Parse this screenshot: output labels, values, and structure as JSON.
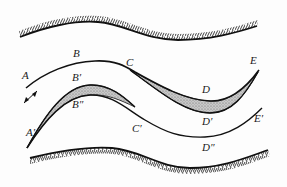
{
  "diagram": {
    "colors": {
      "line": "#111111",
      "bank_hatch": "#2a2a2a",
      "shade_fill": "#bdbdbd",
      "background": "#fdfdfd"
    },
    "banks": [
      {
        "id": "top-bank",
        "hatch_side": "above"
      },
      {
        "id": "bottom-bank",
        "hatch_side": "below"
      }
    ],
    "arrow": {
      "type": "double-headed",
      "label": ""
    },
    "labels": {
      "A": "A",
      "B": "B",
      "C": "C",
      "D": "D",
      "E": "E",
      "A_prime": "A′",
      "B_prime": "B′",
      "B_dprime": "B″",
      "C_prime": "C′",
      "D_prime": "D′",
      "D_dprime": "D″",
      "E_prime": "E′"
    }
  }
}
